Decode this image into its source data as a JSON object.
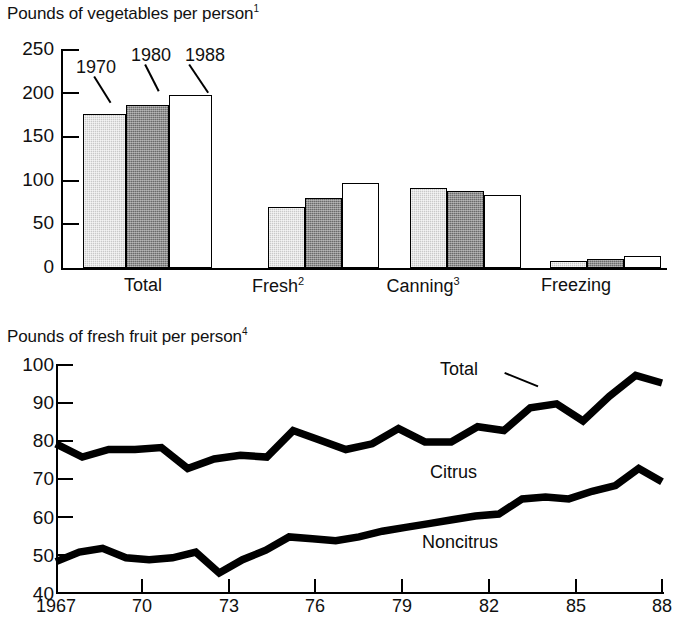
{
  "figure": {
    "panels": [
      "vegetables-bar-chart",
      "fresh-fruit-line-chart"
    ]
  },
  "bar_panel": {
    "title_text": "Pounds of vegetables per person",
    "title_footnote": "1",
    "series_notes": [
      {
        "label": "1970"
      },
      {
        "label": "1980"
      },
      {
        "label": "1988"
      }
    ]
  },
  "line_panel": {
    "title_text": "Pounds of fresh fruit per person",
    "title_footnote": "4",
    "labels": {
      "total": "Total",
      "citrus": "Citrus",
      "noncitrus": "Noncitrus"
    }
  },
  "chart_data": [
    {
      "type": "bar",
      "title": "Pounds of vegetables per person¹",
      "xlabel": "",
      "ylabel": "",
      "ylim": [
        0,
        250
      ],
      "yticks": [
        0,
        50,
        100,
        150,
        200,
        250
      ],
      "ytick_labels": [
        "0",
        "50",
        "100",
        "150",
        "200",
        "250"
      ],
      "grid": false,
      "legend": "in-plot annotations with leader lines",
      "categories": [
        "Total",
        "Fresh²",
        "Canning³",
        "Freezing"
      ],
      "category_plain": [
        "Total",
        "Fresh",
        "Canning",
        "Freezing"
      ],
      "category_footnotes": [
        "",
        "2",
        "3",
        ""
      ],
      "series": [
        {
          "name": "1970",
          "color": "#c9c9c9",
          "fill": "light-gray-halftone",
          "values": [
            176,
            70,
            91,
            8
          ]
        },
        {
          "name": "1980",
          "color": "#8f8f8f",
          "fill": "dark-gray-halftone",
          "values": [
            186,
            80,
            88,
            10
          ]
        },
        {
          "name": "1988",
          "color": "#ffffff",
          "fill": "white",
          "values": [
            197,
            97,
            83,
            14
          ]
        }
      ]
    },
    {
      "type": "line",
      "title": "Pounds of fresh fruit per person⁴",
      "xlabel": "",
      "ylabel": "",
      "ylim": [
        40,
        100
      ],
      "yticks": [
        40,
        50,
        60,
        70,
        80,
        90,
        100
      ],
      "ytick_labels": [
        "40",
        "50",
        "60",
        "70",
        "80",
        "90",
        "100"
      ],
      "xlim": [
        1967,
        1988
      ],
      "xticks": [
        1967,
        1970,
        1973,
        1976,
        1979,
        1982,
        1985,
        1988
      ],
      "xtick_labels": [
        "1967",
        "70",
        "73",
        "76",
        "79",
        "82",
        "85",
        "88"
      ],
      "grid": false,
      "legend": "inline labels (Total, Citrus, Noncitrus)",
      "annotations": [
        {
          "text": "Total",
          "note": "labels upper line, with leader line"
        },
        {
          "text": "Citrus",
          "note": "labels band between the two lines"
        },
        {
          "text": "Noncitrus",
          "note": "labels lower line"
        }
      ],
      "x": [
        1967,
        1968,
        1969,
        1970,
        1971,
        1972,
        1973,
        1974,
        1975,
        1976,
        1977,
        1978,
        1979,
        1980,
        1981,
        1982,
        1983,
        1984,
        1985,
        1986,
        1987,
        1988
      ],
      "series": [
        {
          "name": "Total",
          "color": "#000000",
          "values": [
            79,
            75.5,
            77.5,
            77.5,
            78,
            72.5,
            75,
            76,
            75.5,
            82.5,
            80,
            77.5,
            79,
            83,
            79.5,
            79.5,
            83.5,
            82.5,
            88.5,
            89.5,
            85,
            91.5,
            97,
            95
          ]
        },
        {
          "name": "Noncitrus",
          "color": "#000000",
          "values": [
            48,
            50.5,
            51.5,
            49,
            48.5,
            49,
            50.5,
            45,
            48.5,
            51,
            54.5,
            54,
            53.5,
            54.5,
            56,
            57,
            58,
            59,
            60,
            60.5,
            64.5,
            65,
            64.5,
            66.5,
            68,
            72.5,
            69
          ]
        }
      ]
    }
  ]
}
